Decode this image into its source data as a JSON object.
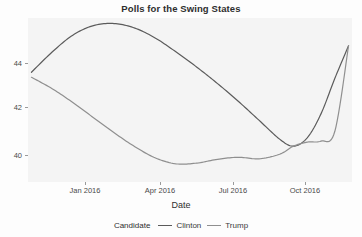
{
  "chart": {
    "title": "Polls for the Swing States",
    "xlabel": "Date",
    "ylabel": "",
    "legend_title": "Candidate"
  },
  "chart_data": {
    "type": "line",
    "title": "Polls for the Swing States",
    "xlabel": "Date",
    "ylabel": "",
    "legend_title": "Candidate",
    "legend_position": "bottom",
    "grid": false,
    "x_tick_labels": [
      "Jan 2016",
      "Apr 2016",
      "Jul 2016",
      "Oct 2016"
    ],
    "x_tick_positions": [
      2016.0,
      2016.25,
      2016.5,
      2016.75
    ],
    "y_tick_labels": [
      "44",
      "42",
      "40"
    ],
    "y_ticks": [
      44,
      42,
      40
    ],
    "xlim": [
      2015.93,
      2016.87
    ],
    "ylim": [
      38.6,
      45.1
    ],
    "series": [
      {
        "name": "Clinton",
        "color": "#5b5b5b",
        "x": [
          2015.94,
          2016.0,
          2016.06,
          2016.12,
          2016.18,
          2016.24,
          2016.3,
          2016.36,
          2016.42,
          2016.48,
          2016.54,
          2016.6,
          2016.66,
          2016.7,
          2016.74,
          2016.78,
          2016.82,
          2016.86
        ],
        "y": [
          42.95,
          43.75,
          44.42,
          44.8,
          44.88,
          44.7,
          44.3,
          43.75,
          43.15,
          42.5,
          41.8,
          41.05,
          40.3,
          40.02,
          40.35,
          41.3,
          42.7,
          44.0
        ]
      },
      {
        "name": "Trump",
        "color": "#8f8f8f",
        "x": [
          2015.94,
          2016.0,
          2016.06,
          2016.12,
          2016.18,
          2016.24,
          2016.3,
          2016.36,
          2016.42,
          2016.48,
          2016.54,
          2016.6,
          2016.66,
          2016.7,
          2016.74,
          2016.78,
          2016.82,
          2016.86
        ],
        "y": [
          42.75,
          42.3,
          41.75,
          41.15,
          40.55,
          40.0,
          39.55,
          39.32,
          39.35,
          39.5,
          39.58,
          39.52,
          39.7,
          40.02,
          40.18,
          40.22,
          40.6,
          44.0
        ]
      }
    ]
  }
}
